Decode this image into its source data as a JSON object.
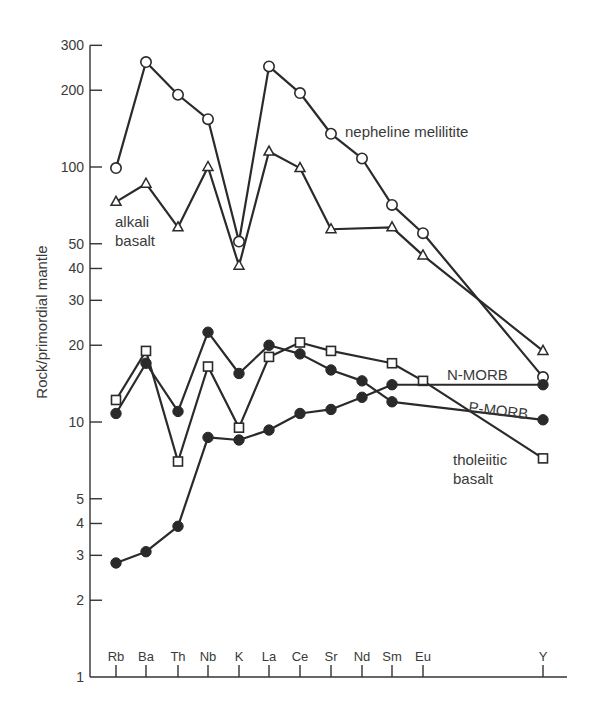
{
  "chart_data": {
    "type": "line",
    "title": "",
    "xlabel": "",
    "ylabel": "Rock/primordial mantle",
    "yscale": "log",
    "ylim": [
      1,
      300
    ],
    "yticks": [
      1,
      2,
      3,
      4,
      5,
      10,
      20,
      30,
      40,
      50,
      100,
      200,
      300
    ],
    "grid": false,
    "legend": "inline labels",
    "categories": [
      "Rb",
      "Ba",
      "Th",
      "Nb",
      "K",
      "La",
      "Ce",
      "Sr",
      "Nd",
      "Sm",
      "Eu",
      "Y"
    ],
    "category_x": [
      116,
      146,
      178,
      208,
      239,
      269,
      300,
      331,
      362,
      392,
      423,
      543
    ],
    "series": [
      {
        "name": "nepheline melilitite",
        "marker": "open-circle",
        "values": [
          99,
          258,
          192,
          154,
          51,
          248,
          195,
          135,
          108,
          71,
          55,
          15
        ],
        "label": {
          "lines": [
            "nepheline melilitite"
          ],
          "x": 345,
          "y": 137
        }
      },
      {
        "name": "alkali basalt",
        "marker": "open-triangle",
        "values": [
          73,
          86,
          58,
          100,
          41,
          115,
          99,
          57,
          null,
          58,
          45,
          19
        ],
        "label": {
          "lines": [
            "alkali",
            "basalt"
          ],
          "x": 115,
          "y": 227
        }
      },
      {
        "name": "tholeiitic basalt",
        "marker": "open-square",
        "values": [
          12.2,
          19,
          7,
          16.5,
          9.5,
          18,
          20.5,
          19,
          null,
          17,
          14.5,
          7.2
        ],
        "label": {
          "lines": [
            "tholeiitic",
            "basalt"
          ],
          "x": 453,
          "y": 465
        }
      },
      {
        "name": "P-MORB",
        "marker": "filled-circle",
        "values": [
          10.8,
          17,
          11,
          22.5,
          15.5,
          20,
          18.5,
          16,
          14.5,
          12,
          null,
          10.2
        ],
        "label": {
          "lines": [
            "P-MORB"
          ],
          "x": 468,
          "y": 412,
          "rotate": 7
        }
      },
      {
        "name": "N-MORB",
        "marker": "filled-circle",
        "values": [
          2.8,
          3.1,
          3.9,
          8.7,
          8.5,
          9.3,
          10.8,
          11.2,
          12.5,
          14,
          null,
          14
        ],
        "label": {
          "lines": [
            "N-MORB"
          ],
          "x": 447,
          "y": 380
        }
      }
    ]
  },
  "axes": {
    "y_title": "Rock/primordial mantle"
  }
}
